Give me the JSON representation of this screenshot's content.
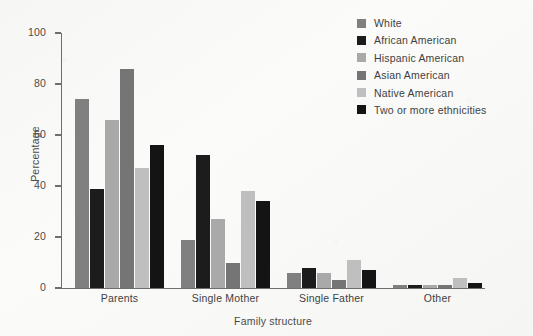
{
  "chart_data": {
    "type": "bar",
    "title": "",
    "xlabel": "Family structure",
    "ylabel": "Percentage",
    "categories": [
      "Parents",
      "Single Mother",
      "Single Father",
      "Other"
    ],
    "ylim": [
      0,
      100
    ],
    "yticks": [
      0,
      20,
      40,
      60,
      80,
      100
    ],
    "grid": false,
    "legend_position": "top-right",
    "series": [
      {
        "name": "White",
        "color": "#808080",
        "values": [
          74,
          19,
          6,
          1
        ]
      },
      {
        "name": "African American",
        "color": "#1c1c1c",
        "values": [
          39,
          52,
          8,
          1
        ]
      },
      {
        "name": "Hispanic American",
        "color": "#a9a9a9",
        "values": [
          66,
          27,
          6,
          1
        ]
      },
      {
        "name": "Asian American",
        "color": "#757575",
        "values": [
          86,
          10,
          3,
          1
        ]
      },
      {
        "name": "Native American",
        "color": "#bfbfbf",
        "values": [
          47,
          38,
          11,
          4
        ]
      },
      {
        "name": "Two or more ethnicities",
        "color": "#141414",
        "values": [
          56,
          34,
          7,
          2
        ]
      }
    ]
  }
}
